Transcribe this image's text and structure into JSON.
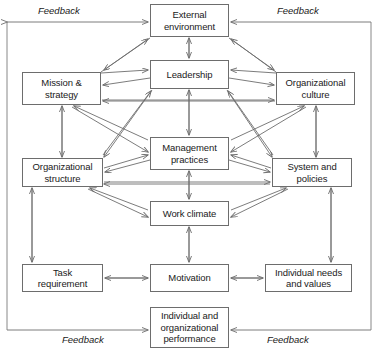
{
  "diagram": {
    "frame_color": "#7a7a7a",
    "line_color": "#6d6d6d",
    "box_border_color": "#6d6d6d",
    "background_color": "#ffffff",
    "text_color": "#1a1a1a",
    "nodes": [
      {
        "id": "external-environment",
        "label": "External\nenvironment",
        "x": 150,
        "y": 4,
        "w": 79,
        "h": 33
      },
      {
        "id": "mission-strategy",
        "label": "Mission &\nstrategy",
        "x": 22,
        "y": 72,
        "w": 79,
        "h": 33
      },
      {
        "id": "leadership",
        "label": "Leadership",
        "x": 150,
        "y": 60,
        "w": 79,
        "h": 29
      },
      {
        "id": "organizational-culture",
        "label": "Organizational\nculture",
        "x": 276,
        "y": 72,
        "w": 79,
        "h": 33
      },
      {
        "id": "organizational-structure",
        "label": "Organizational\nstructure",
        "x": 22,
        "y": 158,
        "w": 81,
        "h": 29
      },
      {
        "id": "management-practices",
        "label": "Management\npractices",
        "x": 150,
        "y": 137,
        "w": 79,
        "h": 33
      },
      {
        "id": "system-and-policies",
        "label": "System and\npolicies",
        "x": 272,
        "y": 158,
        "w": 80,
        "h": 29
      },
      {
        "id": "work-climate",
        "label": "Work climate",
        "x": 150,
        "y": 201,
        "w": 79,
        "h": 25
      },
      {
        "id": "task-requirement",
        "label": "Task\nrequirement",
        "x": 22,
        "y": 264,
        "w": 81,
        "h": 28
      },
      {
        "id": "motivation",
        "label": "Motivation",
        "x": 150,
        "y": 264,
        "w": 79,
        "h": 28
      },
      {
        "id": "individual-needs-and-values",
        "label": "Individual needs\nand values",
        "x": 265,
        "y": 264,
        "w": 87,
        "h": 28
      },
      {
        "id": "individual-and-organizational-performance",
        "label": "Individual and\norganizational\nperformance",
        "x": 150,
        "y": 307,
        "w": 79,
        "h": 41
      }
    ],
    "feedback_labels": [
      {
        "id": "feedback-top-left",
        "text": "Feedback",
        "x": 38,
        "y": 5
      },
      {
        "id": "feedback-top-right",
        "text": "Feedback",
        "x": 277,
        "y": 5
      },
      {
        "id": "feedback-bottom-left",
        "text": "Feedback",
        "x": 62,
        "y": 334
      },
      {
        "id": "feedback-bottom-right",
        "text": "Feedback",
        "x": 267,
        "y": 334
      }
    ]
  }
}
